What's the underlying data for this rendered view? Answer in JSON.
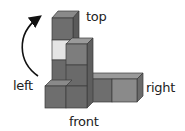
{
  "labels": {
    "top": "top",
    "left": "left",
    "right": "right",
    "front": "front"
  },
  "colors": {
    "dark_front": "#6e6e6e",
    "mid_front": "#7d7d7d",
    "light_front": "#8c8c8c",
    "top_face": "#9a9a9a",
    "side_face": "#5a5a5a",
    "highlight": "#e4e4e4",
    "edge": "#3a3a3a",
    "arrow": "#111111"
  }
}
